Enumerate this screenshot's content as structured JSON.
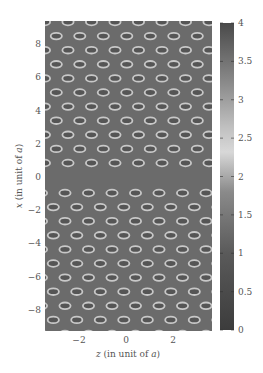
{
  "chart_data": {
    "type": "heatmap",
    "title": "",
    "xlabel": "z (in unit of a)",
    "ylabel": "x (in unit of a)",
    "x_ticks": [
      -2,
      0,
      2
    ],
    "y_ticks": [
      8,
      6,
      4,
      2,
      0,
      -2,
      -4,
      -6,
      -8
    ],
    "xlim": [
      -3.5,
      3.6
    ],
    "ylim": [
      -9.3,
      9.4
    ],
    "grid": false,
    "colorbar": {
      "ticks": [
        "0",
        "0.5",
        "1",
        "1.5",
        "2",
        "2.5",
        "3",
        "3.5",
        "4"
      ],
      "range": [
        0,
        4
      ],
      "colormap": "grayscale (dark at 0 and 4, light near 2.3)"
    },
    "background_value": 1.2,
    "pattern": {
      "description": "Triangular lattice of elliptical ring-shaped features (bright rims ~2.3, dark centers ~0.8) in the z-x plane, with a phase break near x=0",
      "ellipse_pitch_z": 1.0,
      "row_spacing_x": 0.82,
      "ellipse_width_z": 0.5,
      "ellipse_height_x": 0.3
    }
  },
  "axes": {
    "xlabel_parts": {
      "var": "z",
      "rest": " (in unit of ",
      "unit": "a",
      "close": ")"
    },
    "ylabel_parts": {
      "var": "x",
      "rest": " (in unit of ",
      "unit": "a",
      "close": ")"
    },
    "x_tick_labels": [
      "−2",
      "0",
      "2"
    ],
    "y_tick_labels": [
      "8",
      "6",
      "4",
      "2",
      "0",
      "−2",
      "−4",
      "−6",
      "−8"
    ],
    "colorbar_tick_labels": [
      "4",
      "3.5",
      "3",
      "2.5",
      "2",
      "1.5",
      "1",
      "0.5",
      "0"
    ]
  },
  "colors": {
    "background": "#6b6b6b",
    "rim": "#c8c8c8",
    "core": "#555555",
    "text": "#555555"
  }
}
